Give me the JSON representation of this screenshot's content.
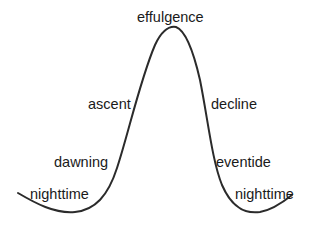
{
  "diagram": {
    "type": "bell-curve",
    "stroke_color": "#2b2b2b",
    "labels": {
      "peak": "effulgence",
      "left_upper": "ascent",
      "right_upper": "decline",
      "left_mid": "dawning",
      "right_mid": "eventide",
      "left_low": "nighttime",
      "right_low": "nighttime"
    }
  }
}
